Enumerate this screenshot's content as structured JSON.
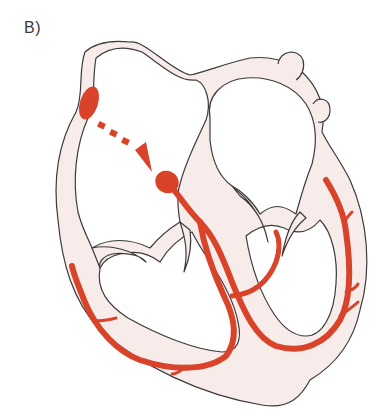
{
  "figure": {
    "panel_label": "B)",
    "colors": {
      "wall_fill": "#f7ecea",
      "outline": "#3b3b3b",
      "conduction": "#d8432a",
      "background": "#ffffff"
    },
    "structures": [
      "sinoatrial-node",
      "internodal-pathway-arrow",
      "atrioventricular-node",
      "bundle-of-his",
      "left-bundle-branch",
      "right-bundle-branch",
      "purkinje-fibers"
    ]
  }
}
